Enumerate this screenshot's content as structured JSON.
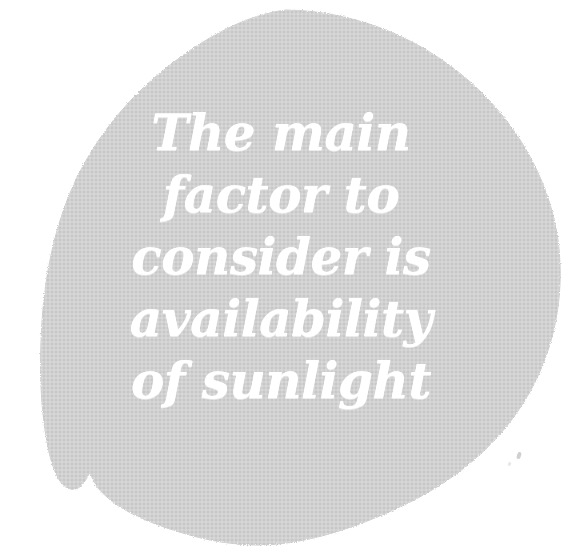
{
  "image": {
    "kind": "scanned-print-graphic",
    "width": 562,
    "height": 550,
    "background_color": "#ffffff"
  },
  "blob": {
    "name": "organic-circle-shape",
    "fill_color": "#c7c7c7",
    "edge_color": "#cfcfcf",
    "texture": "woven-halftone",
    "bounds": {
      "left": 40,
      "top": 10,
      "right": 560,
      "bottom": 546
    }
  },
  "quote": {
    "text_color": "#ffffff",
    "full_text": "The main factor to consider is availability of sunlight",
    "lines": [
      "The main",
      "factor to",
      "consider is",
      "availability",
      "of sunlight"
    ]
  },
  "marks": {
    "speck_label": "scanner-speck"
  }
}
